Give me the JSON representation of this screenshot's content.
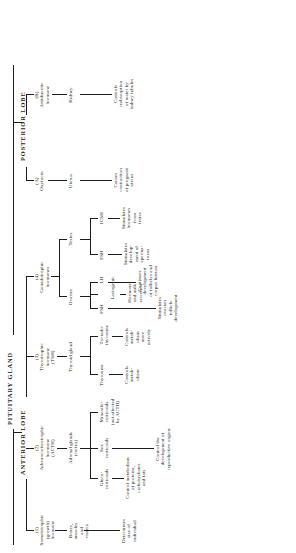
{
  "diagram": {
    "title": "PITUITARY GLAND",
    "type": "hierarchical-tree",
    "orientation": "rotated-90-ccw",
    "lobes": [
      {
        "id": "anterior",
        "label": "ANTERIOR LOBE"
      },
      {
        "id": "posterior",
        "label": "POSTERIOR LOBE"
      }
    ],
    "hormones": {
      "somatotrophic": "(1)\nSomatotrophic\n(growth)\nhormone",
      "acth": "(2)\nAdrenocorticotrophic\nhormone\n(ACTH)",
      "tsh": "(3)\nThyrotrophic\nhormone\n(TSH)",
      "gonadotrophic": "(4)\nGonadotrophic\nhormones",
      "oxytocin": "(A)\nOxytocin",
      "adh": "(B)\nAntidiuretic\nhormone"
    },
    "targets": {
      "bones": "Bones,\nmuscles\nand\nviscera",
      "adrenal": "Adrenal glands\n(cortex)",
      "thyroid": "Thyroid gland",
      "ovaries": "Ovaries",
      "testes": "Testes",
      "uterus": "Uterus",
      "kidney": "Kidney"
    },
    "secretions": {
      "gluco": "Gluco-\ncorticoids",
      "sex": "Sex\ncorticoids",
      "mineralo": "Mineralo-\ncorticoids\n(not affected\nby ACTH)",
      "thyroxine": "Thyroxine",
      "triiodo": "Tri-iodo-\nthyronine",
      "fsh_ov": "FSH",
      "lh": "LH",
      "lactogenic": "Lactogenic",
      "fsh_te": "FSH",
      "icsh": "ICSH"
    },
    "effects": {
      "size": "Determines\nsize of\nindividual",
      "metabolism": "Control metabolism\nof proteins,\ncarbohydrates\nand fats",
      "repro": "Control the\ndevelopment of\nreproductive organs",
      "metab_basic": "Controls\nmetab-\nolism",
      "metab_active": "Controls\nmetab-\nolism\nmore\nactively",
      "ovarian_follicle": "Stimulates\novarian\nfollicle\ndevelopment",
      "corpus_luteum": "Continues\ndevelopment\nof follicles and\ncorpus luteum",
      "milk": "Hormone\nand milk\nsecretion",
      "spermatozoa": "Stimulates\ndevelop-\nment of\nsperma-\ntozoa",
      "testes_hormones": "Stimulates\nhormones\nfrom\ntestes",
      "uterus_contract": "Causes\ncontraction\nof pregnant\nuterus",
      "kidney_water": "Controls\nreabsorption\nof water by\nkidney tubules"
    }
  }
}
